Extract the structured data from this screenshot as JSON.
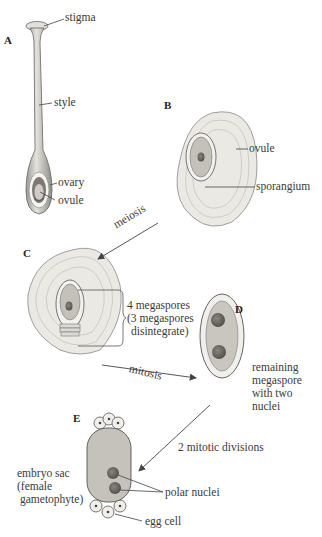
{
  "diagram": {
    "type": "flowering-plant female gametophyte development",
    "colors": {
      "tissue_fill": "#e8e6e1",
      "cell_outline": "#9a9a9a",
      "sporangium_fill": "#bdbab4",
      "nucleus_fill": "#6e6a66",
      "line": "#444444"
    },
    "panels": {
      "A": {
        "label": "A",
        "parts": [
          "stigma",
          "style",
          "ovary",
          "ovule"
        ]
      },
      "B": {
        "label": "B",
        "parts": [
          "ovule",
          "sporangium"
        ]
      },
      "C": {
        "label": "C",
        "annotation_line1": "4 megaspores",
        "annotation_line2": "(3 megaspores",
        "annotation_line3": "disintegrate)"
      },
      "D": {
        "label": "D",
        "annotation_line1": "remaining",
        "annotation_line2": "megaspore",
        "annotation_line3": "with two",
        "annotation_line4": "nuclei"
      },
      "E": {
        "label": "E",
        "embryo_line1": "embryo sac",
        "embryo_line2": "(female",
        "embryo_line3": "gametophyte)",
        "polar": "polar nuclei",
        "egg": "egg cell"
      }
    },
    "arrows": {
      "b_to_c": "meiosis",
      "c_to_d": "mitosis",
      "d_to_e": "2 mitotic divisions"
    }
  }
}
